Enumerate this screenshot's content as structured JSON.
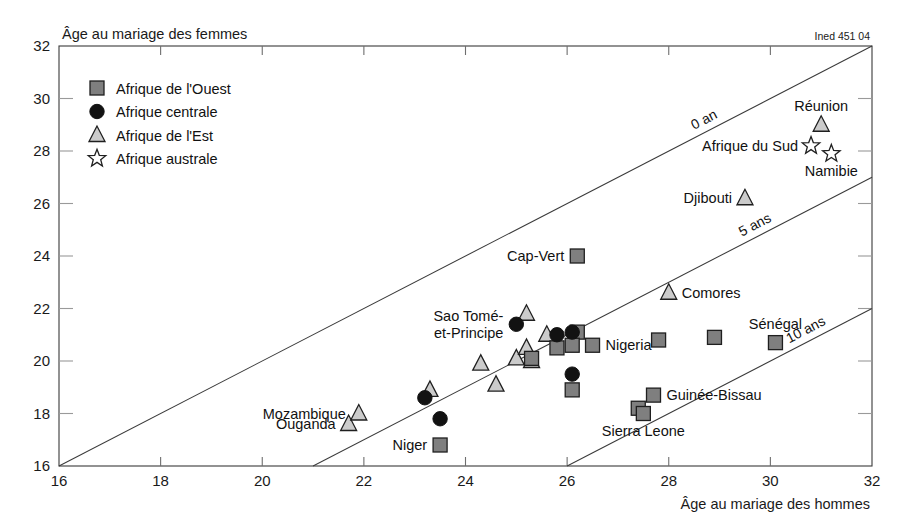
{
  "credit": "Ined 451 04",
  "chart_data": {
    "type": "scatter",
    "title": "",
    "ylabel": "Âge au mariage des femmes",
    "xlabel": "Âge au mariage des hommes",
    "xlim": [
      16,
      32
    ],
    "ylim": [
      16,
      32
    ],
    "xticks": [
      16,
      18,
      20,
      22,
      24,
      26,
      28,
      30,
      32
    ],
    "yticks": [
      16,
      18,
      20,
      22,
      24,
      26,
      28,
      30,
      32
    ],
    "grid": false,
    "legend_position": "top-left",
    "legend": [
      {
        "label": "Afrique de l'Ouest",
        "marker": "square",
        "fill": "#7f7f7f",
        "stroke": "#1a1a1a"
      },
      {
        "label": "Afrique centrale",
        "marker": "circle",
        "fill": "#111111",
        "stroke": "#111111"
      },
      {
        "label": "Afrique de l'Est",
        "marker": "triangle",
        "fill": "#c8c8c8",
        "stroke": "#1a1a1a"
      },
      {
        "label": "Afrique australe",
        "marker": "star",
        "fill": "#ffffff",
        "stroke": "#1a1a1a"
      }
    ],
    "reference_lines": [
      {
        "label": "0 an",
        "difference": 0,
        "x_start": 16,
        "x_end": 32
      },
      {
        "label": "5 ans",
        "difference": 5,
        "x_start": 21,
        "x_end": 32
      },
      {
        "label": "10 ans",
        "difference": 10,
        "x_start": 26,
        "x_end": 32
      }
    ],
    "series": [
      {
        "name": "Afrique de l'Ouest",
        "marker": "square",
        "points": [
          {
            "x": 23.5,
            "y": 16.8,
            "label": "Niger",
            "label_pos": "left"
          },
          {
            "x": 25.3,
            "y": 20.1,
            "label": "",
            "label_pos": ""
          },
          {
            "x": 25.8,
            "y": 20.5,
            "label": "",
            "label_pos": ""
          },
          {
            "x": 26.2,
            "y": 21.1,
            "label": "",
            "label_pos": ""
          },
          {
            "x": 26.1,
            "y": 20.6,
            "label": "",
            "label_pos": ""
          },
          {
            "x": 26.5,
            "y": 20.6,
            "label": "Nigeria",
            "label_pos": "right"
          },
          {
            "x": 26.1,
            "y": 18.9,
            "label": "",
            "label_pos": ""
          },
          {
            "x": 26.2,
            "y": 24.0,
            "label": "Cap-Vert",
            "label_pos": "left"
          },
          {
            "x": 27.4,
            "y": 18.2,
            "label": "",
            "label_pos": ""
          },
          {
            "x": 27.5,
            "y": 18.0,
            "label": "Sierra Leone",
            "label_pos": "below"
          },
          {
            "x": 27.7,
            "y": 18.7,
            "label": "Guinée-Bissau",
            "label_pos": "right"
          },
          {
            "x": 27.8,
            "y": 20.8,
            "label": "",
            "label_pos": ""
          },
          {
            "x": 28.9,
            "y": 20.9,
            "label": "",
            "label_pos": ""
          },
          {
            "x": 30.1,
            "y": 20.7,
            "label": "Sénégal",
            "label_pos": "above"
          }
        ]
      },
      {
        "name": "Afrique centrale",
        "marker": "circle",
        "points": [
          {
            "x": 23.2,
            "y": 18.6,
            "label": "",
            "label_pos": ""
          },
          {
            "x": 23.5,
            "y": 17.8,
            "label": "",
            "label_pos": ""
          },
          {
            "x": 25.0,
            "y": 21.4,
            "label": "Sao Tomé-et-Principe",
            "label_pos": "left"
          },
          {
            "x": 25.8,
            "y": 21.0,
            "label": "",
            "label_pos": ""
          },
          {
            "x": 26.1,
            "y": 21.1,
            "label": "",
            "label_pos": ""
          },
          {
            "x": 26.1,
            "y": 19.5,
            "label": "",
            "label_pos": ""
          }
        ]
      },
      {
        "name": "Afrique de l'Est",
        "marker": "triangle",
        "points": [
          {
            "x": 21.7,
            "y": 17.6,
            "label": "Ouganda",
            "label_pos": "left"
          },
          {
            "x": 21.9,
            "y": 18.0,
            "label": "Mozambique",
            "label_pos": "left"
          },
          {
            "x": 23.3,
            "y": 18.9,
            "label": "",
            "label_pos": ""
          },
          {
            "x": 24.3,
            "y": 19.9,
            "label": "",
            "label_pos": ""
          },
          {
            "x": 24.6,
            "y": 19.1,
            "label": "",
            "label_pos": ""
          },
          {
            "x": 25.0,
            "y": 20.1,
            "label": "",
            "label_pos": ""
          },
          {
            "x": 25.2,
            "y": 21.8,
            "label": "",
            "label_pos": ""
          },
          {
            "x": 25.2,
            "y": 20.5,
            "label": "",
            "label_pos": ""
          },
          {
            "x": 25.3,
            "y": 20.0,
            "label": "",
            "label_pos": ""
          },
          {
            "x": 25.6,
            "y": 21.0,
            "label": "",
            "label_pos": ""
          },
          {
            "x": 28.0,
            "y": 22.6,
            "label": "Comores",
            "label_pos": "right"
          },
          {
            "x": 29.5,
            "y": 26.2,
            "label": "Djibouti",
            "label_pos": "left"
          },
          {
            "x": 31.0,
            "y": 29.0,
            "label": "Réunion",
            "label_pos": "above"
          }
        ]
      },
      {
        "name": "Afrique australe",
        "marker": "star",
        "points": [
          {
            "x": 30.8,
            "y": 28.2,
            "label": "Afrique du Sud",
            "label_pos": "left"
          },
          {
            "x": 31.2,
            "y": 27.9,
            "label": "Namibie",
            "label_pos": "below"
          }
        ]
      }
    ]
  }
}
